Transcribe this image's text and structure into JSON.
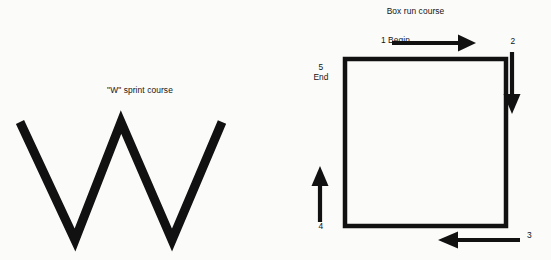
{
  "page": {
    "background_color": "#fbfbfa",
    "ink_color": "#141414",
    "width": 551,
    "height": 260
  },
  "sprint_course": {
    "title": "\"W\" sprint course",
    "shape_name": "w-polyline",
    "stroke_color": "#111111",
    "stroke_width": 9,
    "vertices": [
      {
        "x": 20,
        "y": 122
      },
      {
        "x": 75,
        "y": 240
      },
      {
        "x": 121,
        "y": 122
      },
      {
        "x": 172,
        "y": 240
      },
      {
        "x": 222,
        "y": 122
      }
    ]
  },
  "box_course": {
    "title": "Box run course",
    "stroke_color": "#111111",
    "stroke_width": 4,
    "box": {
      "x": 63,
      "y": 57,
      "width": 165,
      "height": 171
    },
    "steps": [
      {
        "id": "1",
        "label": "1 Begin",
        "direction": "right",
        "position": "top"
      },
      {
        "id": "2",
        "label": "2",
        "direction": "down",
        "position": "right"
      },
      {
        "id": "3",
        "label": "3",
        "direction": "left",
        "position": "bottom"
      },
      {
        "id": "4",
        "label": "4",
        "direction": "up",
        "position": "left"
      },
      {
        "id": "5",
        "label_number": "5",
        "label_text": "End",
        "position": "top-left"
      }
    ],
    "begin_label": "1 Begin",
    "end_number": "5",
    "end_text": "End",
    "step_two": "2",
    "step_three": "3",
    "step_four": "4"
  }
}
